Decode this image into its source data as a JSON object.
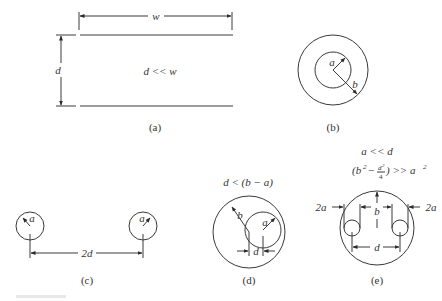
{
  "figure": {
    "panels": [
      {
        "id": "a",
        "label": "(a)",
        "description": "Parallel plate line",
        "dims": {
          "width": "w",
          "separation": "d"
        },
        "condition": "d << w"
      },
      {
        "id": "b",
        "label": "(b)",
        "description": "Coaxial line",
        "dims": {
          "inner_radius": "a",
          "outer_radius": "b"
        }
      },
      {
        "id": "c",
        "label": "(c)",
        "description": "Two-wire line",
        "dims": {
          "radius_left": "a",
          "radius_right": "a",
          "spacing": "2d"
        }
      },
      {
        "id": "d",
        "label": "(d)",
        "description": "Eccentric coaxial line",
        "dims": {
          "outer_radius": "b",
          "inner_radius": "a",
          "offset": "d"
        },
        "condition": "d < (b − a)"
      },
      {
        "id": "e",
        "label": "(e)",
        "description": "Shielded two-wire line",
        "dims": {
          "wire_diameter_left": "2a",
          "wire_diameter_right": "2a",
          "shield_radius": "b",
          "spacing": "d"
        },
        "conditions": [
          "a << d",
          "(b² − d²/4) >> a²"
        ]
      }
    ],
    "text": {
      "a_w": "w",
      "a_d": "d",
      "a_cond": "d << w",
      "b_a": "a",
      "b_b": "b",
      "c_a1": "a",
      "c_a2": "a",
      "c_2d": "2d",
      "d_cond": "d < (b − a)",
      "d_b": "b",
      "d_a": "a",
      "d_d": "d",
      "e_cond1": "a << d",
      "e_cond2_open": "(b",
      "e_cond2_sup": "2",
      "e_cond2_minus": "−",
      "e_cond2_num": "d",
      "e_cond2_numsup": "2",
      "e_cond2_den": "4",
      "e_cond2_close": ") >> a",
      "e_cond2_asup": "2",
      "e_2a_left": "2a",
      "e_2a_right": "2a",
      "e_b": "b",
      "e_d": "d",
      "label_a": "(a)",
      "label_b": "(b)",
      "label_c": "(c)",
      "label_d": "(d)",
      "label_e": "(e)"
    },
    "colors": {
      "line": "#3a3a3a",
      "text": "#333333",
      "background": "#ffffff"
    }
  }
}
